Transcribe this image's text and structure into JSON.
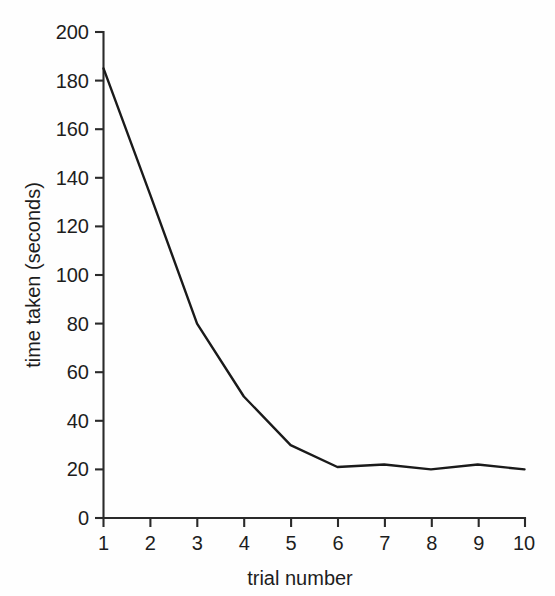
{
  "chart_data": {
    "type": "line",
    "title": "",
    "xlabel": "trial number",
    "ylabel": "time taken (seconds)",
    "categories": [
      1,
      2,
      3,
      4,
      5,
      6,
      7,
      8,
      9,
      10
    ],
    "x": [
      1,
      2,
      3,
      4,
      5,
      6,
      7,
      8,
      9,
      10
    ],
    "values": [
      185,
      133,
      80,
      50,
      30,
      21,
      22,
      20,
      22,
      20
    ],
    "series": [
      {
        "name": "time taken",
        "values": [
          185,
          133,
          80,
          50,
          30,
          21,
          22,
          20,
          22,
          20
        ]
      }
    ],
    "xlim": [
      1,
      10
    ],
    "ylim": [
      0,
      200
    ],
    "xticks": [
      "1",
      "2",
      "3",
      "4",
      "5",
      "6",
      "7",
      "8",
      "9",
      "10"
    ],
    "yticks": [
      "0",
      "20",
      "40",
      "60",
      "80",
      "100",
      "120",
      "140",
      "160",
      "180",
      "200"
    ],
    "ytick_values": [
      0,
      20,
      40,
      60,
      80,
      100,
      120,
      140,
      160,
      180,
      200
    ],
    "grid": false,
    "legend": "none",
    "line_color": "#1a1a1a",
    "axis_color": "#2a2a2a",
    "background_color": "#fefefe"
  },
  "figure": {
    "y_axis_label": "time taken (seconds)",
    "x_axis_label": "trial number"
  }
}
